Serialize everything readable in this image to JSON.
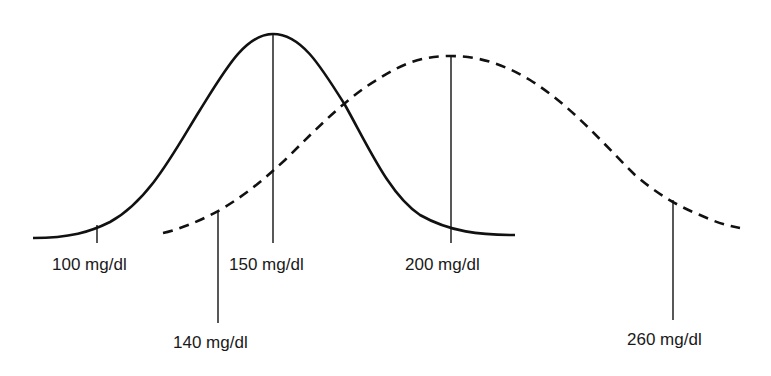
{
  "diagram": {
    "type": "two overlapping normal distribution curves",
    "curves": [
      {
        "name": "solid-curve",
        "style": "solid",
        "peak_label": "150 mg/dl"
      },
      {
        "name": "dashed-curve",
        "style": "dashed",
        "peak_label": "200 mg/dl"
      }
    ],
    "labels": {
      "l100": "100 mg/dl",
      "l150": "150 mg/dl",
      "l200": "200 mg/dl",
      "l140": "140 mg/dl",
      "l260": "260 mg/dl"
    },
    "colors": {
      "stroke": "#111111",
      "background": "#ffffff"
    }
  }
}
